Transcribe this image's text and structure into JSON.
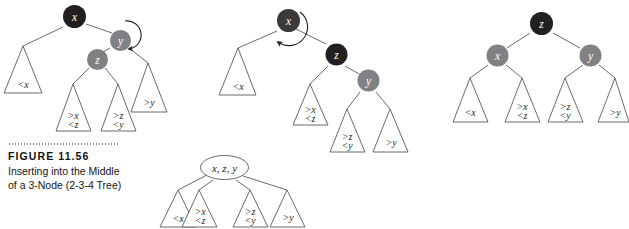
{
  "figure": {
    "number_label": "FIGURE 11.56",
    "caption_line_1": "Inserting into the Middle",
    "caption_line_2": "of a 3-Node (2-3-4 Tree)"
  },
  "colors": {
    "node_black": "#231f20",
    "node_dark_gray": "#3a3a3c",
    "node_gray": "#808184",
    "node_white": "#ffffff",
    "stroke": "#58595b",
    "label_white": "#ffffff",
    "label_dark": "#231f20"
  },
  "diagrams": [
    {
      "name": "tree-before-rotation",
      "nodes": [
        {
          "id": "x",
          "label": "x",
          "fill": "black",
          "text": "white"
        },
        {
          "id": "y",
          "label": "y",
          "fill": "gray",
          "text": "white",
          "highlight": "rotation-circle"
        },
        {
          "id": "z",
          "label": "z",
          "fill": "gray",
          "text": "white"
        }
      ],
      "subtrees": [
        {
          "id": "lt-x",
          "lines": [
            "<x"
          ]
        },
        {
          "id": "gt-x-lt-z",
          "lines": [
            ">x",
            "<z"
          ]
        },
        {
          "id": "gt-z-lt-y",
          "lines": [
            ">z",
            "<y"
          ]
        },
        {
          "id": "gt-y",
          "lines": [
            ">y"
          ]
        }
      ],
      "annotation": "curved-rotation-arrow-around-y"
    },
    {
      "name": "tree-after-first-rotation",
      "nodes": [
        {
          "id": "x",
          "label": "x",
          "fill": "black",
          "text": "white",
          "highlight": "rotation-circle"
        },
        {
          "id": "z",
          "label": "z",
          "fill": "black",
          "text": "white"
        },
        {
          "id": "y",
          "label": "y",
          "fill": "gray",
          "text": "white"
        }
      ],
      "subtrees": [
        {
          "id": "lt-x",
          "lines": [
            "<x"
          ]
        },
        {
          "id": "gt-x-lt-z",
          "lines": [
            ">x",
            "<z"
          ]
        },
        {
          "id": "gt-z-lt-y",
          "lines": [
            ">z",
            "<y"
          ]
        },
        {
          "id": "gt-y",
          "lines": [
            ">y"
          ]
        }
      ],
      "annotation": "curved-rotation-arrow-around-x"
    },
    {
      "name": "tree-after-second-rotation",
      "nodes": [
        {
          "id": "z",
          "label": "z",
          "fill": "black",
          "text": "white"
        },
        {
          "id": "x",
          "label": "x",
          "fill": "gray",
          "text": "white"
        },
        {
          "id": "y",
          "label": "y",
          "fill": "gray",
          "text": "white"
        }
      ],
      "subtrees": [
        {
          "id": "lt-x",
          "lines": [
            "<x"
          ]
        },
        {
          "id": "gt-x-lt-z",
          "lines": [
            ">x",
            "<z"
          ]
        },
        {
          "id": "gt-z-lt-y",
          "lines": [
            ">z",
            "<y"
          ]
        },
        {
          "id": "gt-y",
          "lines": [
            ">y"
          ]
        }
      ],
      "annotation": "none"
    },
    {
      "name": "tree-equivalent-4-node",
      "nodes": [
        {
          "id": "xzy",
          "label": "x, z, y",
          "fill": "white",
          "text": "dark"
        }
      ],
      "subtrees": [
        {
          "id": "lt-x",
          "lines": [
            "<x"
          ]
        },
        {
          "id": "gt-x-lt-z",
          "lines": [
            ">x",
            "<z"
          ]
        },
        {
          "id": "gt-z-lt-y",
          "lines": [
            ">z",
            "<y"
          ]
        },
        {
          "id": "gt-y",
          "lines": [
            ">y"
          ]
        }
      ],
      "annotation": "none"
    }
  ]
}
